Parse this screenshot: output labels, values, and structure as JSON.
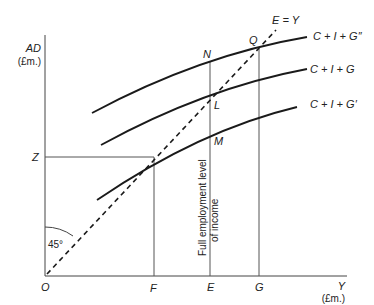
{
  "diagram": {
    "axes": {
      "y_label_main": "AD",
      "y_label_unit": "(£m.)",
      "x_label_main": "Y",
      "x_label_unit": "(£m.)",
      "origin": "O"
    },
    "x_points": {
      "F": "F",
      "E": "E",
      "G": "G"
    },
    "y_points": {
      "Z": "Z"
    },
    "intersection_points": {
      "N": "N",
      "Q": "Q",
      "L": "L",
      "M": "M"
    },
    "curves": {
      "top": "C + I + G″",
      "middle": "C + I + G",
      "bottom": "C + I + G′"
    },
    "diagonal_label": "E = Y",
    "angle_label": "45°",
    "vertical_annotation_line1": "Full employment level",
    "vertical_annotation_line2": "of income",
    "colors": {
      "line": "#1a1a1a",
      "guide": "#555555",
      "text": "#222222"
    }
  }
}
